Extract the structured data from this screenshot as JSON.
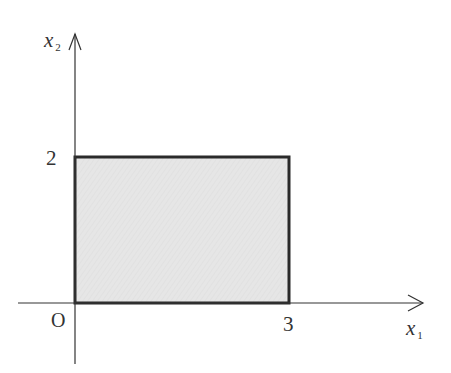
{
  "diagram": {
    "type": "feasible-region",
    "shape": "rectangle",
    "region_fill": "#e8e8e8",
    "stroke_color": "#2a2a2a",
    "axes": {
      "x_label": "x",
      "x_subscript": "1",
      "y_label": "x",
      "y_subscript": "2",
      "origin_label": "O"
    },
    "ticks": {
      "x_tick": "3",
      "y_tick": "2"
    },
    "region": {
      "x_min": 0,
      "x_max": 3,
      "y_min": 0,
      "y_max": 2
    }
  }
}
